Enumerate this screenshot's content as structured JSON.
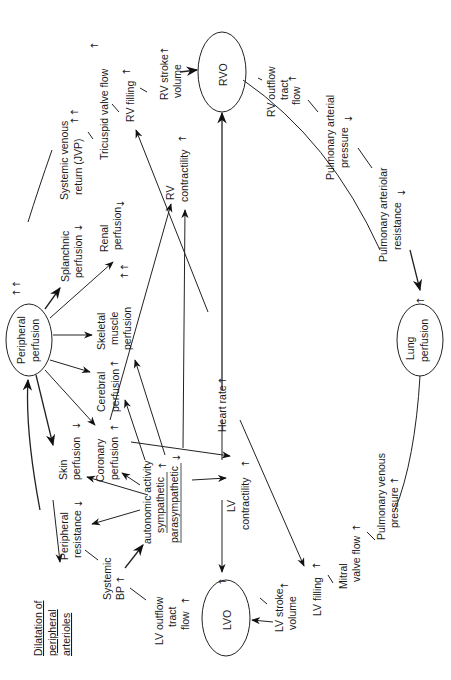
{
  "diagram": {
    "orientation": "rotated 90 degrees counter-clockwise",
    "nodes": {
      "rvo": {
        "label": "RVO"
      },
      "lvo": {
        "label": "LVO"
      },
      "lung": {
        "label": [
          "Lung",
          "perfusion"
        ]
      },
      "peripheral": {
        "label": [
          "Peripheral",
          "perfusion"
        ]
      },
      "rv_stroke": {
        "label": [
          "RV stroke",
          "volume"
        ],
        "change": "↑"
      },
      "rv_filling": {
        "label": "RV filling",
        "change": "↑"
      },
      "tricuspid": {
        "label": "Tricuspid valve flow",
        "change": "↑"
      },
      "systemic_venous": {
        "label": [
          "Systemic venous",
          "return (JVP)"
        ],
        "change": "↑↑"
      },
      "rv_contractility": {
        "label": [
          "RV",
          "contractility"
        ],
        "change": "↑"
      },
      "rv_outflow": {
        "label": [
          "RV outflow",
          "tract",
          "flow"
        ],
        "change": "↑"
      },
      "pulm_arterial_pressure": {
        "label": [
          "Pulmonary arterial",
          "pressure"
        ],
        "change": "↓"
      },
      "pulm_arteriolar_resistance": {
        "label": [
          "Pulmonary arteriolar",
          "resistance"
        ],
        "change": "↓"
      },
      "lung_change": {
        "change": "↑"
      },
      "splanchnic": {
        "label": [
          "Splanchnic",
          "perfusion"
        ],
        "change": "↓"
      },
      "renal": {
        "label": [
          "Renal",
          "perfusion"
        ],
        "change": "↓"
      },
      "skeletal": {
        "label": [
          "Skeletal",
          "muscle",
          "perfusion"
        ],
        "change": "↑↑"
      },
      "cerebral": {
        "label": [
          "Cerebral",
          "perfusion"
        ],
        "change": "↑"
      },
      "coronary": {
        "label": [
          "Coronary",
          "perfusion"
        ],
        "change": "↑"
      },
      "skin": {
        "label": [
          "Skin",
          "perfusion"
        ],
        "change": "↓"
      },
      "peripheral_changes": {
        "change": "↑↑"
      },
      "heart_rate": {
        "label": "Heart rate",
        "change": "↑"
      },
      "autonomic": {
        "label": [
          "autonomic activity",
          "sympathetic",
          "parasympathetic"
        ],
        "change": "↑",
        "change2": "↓"
      },
      "lv_contractility": {
        "label": [
          "LV",
          "contractility"
        ],
        "change": "↑"
      },
      "peripheral_resistance": {
        "label": [
          "Peripheral",
          "resistance"
        ],
        "change": "↓"
      },
      "systemic_bp": {
        "label": [
          "Systemic",
          "BP"
        ],
        "change": "↑"
      },
      "dilatation": {
        "label": [
          "Dilatation of",
          "peripheral",
          "arterioles"
        ]
      },
      "lv_outflow": {
        "label": [
          "LV outflow",
          "tract",
          "flow"
        ],
        "change": "↑"
      },
      "lvo_change": {
        "change": "↑"
      },
      "lv_stroke": {
        "label": [
          "LV stroke",
          "volume"
        ],
        "change": "↑"
      },
      "lv_filling": {
        "label": "LV filling",
        "change": "↑"
      },
      "mitral": {
        "label": [
          "Mitral",
          "valve flow"
        ],
        "change": "↑"
      },
      "pulm_venous": {
        "label": [
          "Pulmonary venous",
          "pressure"
        ],
        "change": "↑"
      }
    }
  }
}
